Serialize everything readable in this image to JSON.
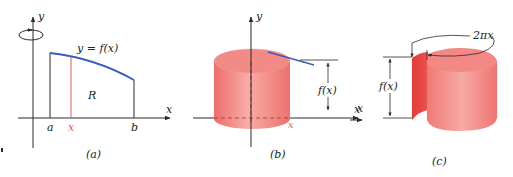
{
  "figure": {
    "colors": {
      "axis": "#2a2a2a",
      "curve": "#3a5bbf",
      "strip": "#e05a5a",
      "shell_fill": "#f07b78",
      "shell_dark": "#e0403c",
      "shell_light": "#f7a9a4",
      "background": "#ffffff"
    },
    "panel_a": {
      "caption": "(a)",
      "axis_x_label": "x",
      "axis_y_label": "y",
      "curve_label": "y = f(x)",
      "region_label": "R",
      "tick_a": "a",
      "tick_x": "x",
      "tick_b": "b",
      "rotation_icon": "rotation-arrow-icon"
    },
    "panel_b": {
      "caption": "(b)",
      "axis_x_label": "x",
      "axis_y_label": "y",
      "tick_x": "x",
      "height_label": "f(x)"
    },
    "panel_c": {
      "caption": "(c)",
      "axis_x_label": "x",
      "height_label": "f(x)",
      "circumference_label": "2πx"
    }
  }
}
